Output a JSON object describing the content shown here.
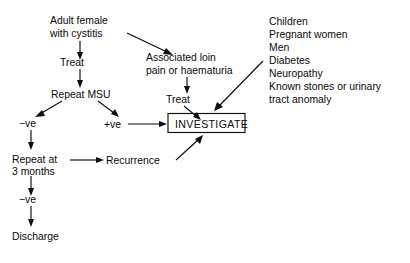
{
  "diagram": {
    "background_color": "#ffffff",
    "ink_color": "#0d0d0d",
    "nodes": {
      "start": {
        "line1": "Adult female",
        "line2": "with cystitis"
      },
      "treat_left": {
        "label": "Treat"
      },
      "repeat_msu": {
        "label": "Repeat MSU"
      },
      "negative_first": {
        "label": "−ve"
      },
      "positive": {
        "label": "+ve"
      },
      "repeat_at": {
        "line1": "Repeat at",
        "line2": "3 months"
      },
      "negative_second": {
        "label": "−ve"
      },
      "discharge": {
        "label": "Discharge"
      },
      "recurrence": {
        "label": "Recurrence"
      },
      "associated": {
        "line1": "Associated loin",
        "line2": "pain or haematuria"
      },
      "treat_right": {
        "label": "Treat"
      },
      "investigate": {
        "label": "INVESTIGATE"
      }
    },
    "risk_list": {
      "items": [
        "Children",
        "Pregnant women",
        "Men",
        "Diabetes",
        "Neuropathy",
        "Known stones or urinary",
        "tract anomaly"
      ]
    }
  }
}
